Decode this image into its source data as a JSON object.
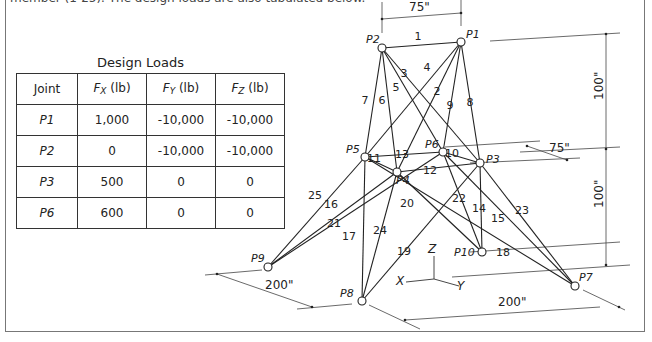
{
  "header": {
    "partial_text": "member (1-25). The design loads are also tabulated below."
  },
  "design_loads": {
    "title": "Design Loads",
    "columns": [
      "Joint",
      "Fx (lb)",
      "Fy (lb)",
      "Fz (lb)"
    ],
    "column_symbols": [
      {
        "sym": "",
        "sub": "",
        "unit": "Joint"
      },
      {
        "sym": "F",
        "sub": "X",
        "unit": " (lb)"
      },
      {
        "sym": "F",
        "sub": "Y",
        "unit": " (lb)"
      },
      {
        "sym": "F",
        "sub": "Z",
        "unit": " (lb)"
      }
    ],
    "rows": [
      {
        "joint": "P1",
        "fx": "1,000",
        "fy": "-10,000",
        "fz": "-10,000"
      },
      {
        "joint": "P2",
        "fx": "0",
        "fy": "-10,000",
        "fz": "-10,000"
      },
      {
        "joint": "P3",
        "fx": "500",
        "fy": "0",
        "fz": "0"
      },
      {
        "joint": "P6",
        "fx": "600",
        "fy": "0",
        "fz": "0"
      }
    ]
  },
  "truss": {
    "nodes": {
      "P1": {
        "x": 461,
        "y": 42,
        "label": "P1"
      },
      "P2": {
        "x": 382,
        "y": 48,
        "label": "P2"
      },
      "P3": {
        "x": 480,
        "y": 163,
        "label": "P3"
      },
      "P4": {
        "x": 397,
        "y": 172,
        "label": "P4"
      },
      "P5": {
        "x": 365,
        "y": 157,
        "label": "P5"
      },
      "P6": {
        "x": 443,
        "y": 152,
        "label": "P6"
      },
      "P7": {
        "x": 575,
        "y": 286,
        "label": "P7"
      },
      "P8": {
        "x": 362,
        "y": 301,
        "label": "P8"
      },
      "P9": {
        "x": 268,
        "y": 267,
        "label": "P9"
      },
      "P10": {
        "x": 482,
        "y": 252,
        "label": "P10"
      }
    },
    "members": [
      {
        "id": "1",
        "from": "P2",
        "to": "P1"
      },
      {
        "id": "2",
        "from": "P1",
        "to": "P4"
      },
      {
        "id": "3",
        "from": "P2",
        "to": "P3"
      },
      {
        "id": "4",
        "from": "P1",
        "to": "P5"
      },
      {
        "id": "5",
        "from": "P2",
        "to": "P6"
      },
      {
        "id": "6",
        "from": "P2",
        "to": "P4"
      },
      {
        "id": "7",
        "from": "P2",
        "to": "P5"
      },
      {
        "id": "8",
        "from": "P1",
        "to": "P3"
      },
      {
        "id": "9",
        "from": "P1",
        "to": "P6"
      },
      {
        "id": "10",
        "from": "P6",
        "to": "P3"
      },
      {
        "id": "11",
        "from": "P5",
        "to": "P4"
      },
      {
        "id": "12",
        "from": "P4",
        "to": "P3"
      },
      {
        "id": "13",
        "from": "P5",
        "to": "P6"
      },
      {
        "id": "14",
        "from": "P3",
        "to": "P10"
      },
      {
        "id": "15",
        "from": "P6",
        "to": "P7"
      },
      {
        "id": "16",
        "from": "P4",
        "to": "P9"
      },
      {
        "id": "17",
        "from": "P5",
        "to": "P8"
      },
      {
        "id": "18",
        "from": "P5",
        "to": "P7"
      },
      {
        "id": "19",
        "from": "P3",
        "to": "P8"
      },
      {
        "id": "20",
        "from": "P4",
        "to": "P10"
      },
      {
        "id": "21",
        "from": "P6",
        "to": "P9"
      },
      {
        "id": "22",
        "from": "P6",
        "to": "P10"
      },
      {
        "id": "23",
        "from": "P3",
        "to": "P7"
      },
      {
        "id": "24",
        "from": "P4",
        "to": "P8"
      },
      {
        "id": "25",
        "from": "P5",
        "to": "P9"
      }
    ],
    "member_labels": [
      {
        "id": "1",
        "x": 418,
        "y": 40
      },
      {
        "id": "2",
        "x": 437,
        "y": 95
      },
      {
        "id": "3",
        "x": 404,
        "y": 77
      },
      {
        "id": "4",
        "x": 427,
        "y": 71
      },
      {
        "id": "5",
        "x": 396,
        "y": 91
      },
      {
        "id": "6",
        "x": 382,
        "y": 104
      },
      {
        "id": "7",
        "x": 365,
        "y": 104
      },
      {
        "id": "8",
        "x": 470,
        "y": 106
      },
      {
        "id": "9",
        "x": 450,
        "y": 109
      },
      {
        "id": "10",
        "x": 452,
        "y": 157
      },
      {
        "id": "11",
        "x": 374,
        "y": 162
      },
      {
        "id": "12",
        "x": 430,
        "y": 174
      },
      {
        "id": "13",
        "x": 402,
        "y": 158
      },
      {
        "id": "14",
        "x": 479,
        "y": 212
      },
      {
        "id": "15",
        "x": 498,
        "y": 222
      },
      {
        "id": "16",
        "x": 331,
        "y": 208
      },
      {
        "id": "17",
        "x": 349,
        "y": 240
      },
      {
        "id": "18",
        "x": 503,
        "y": 256
      },
      {
        "id": "19",
        "x": 404,
        "y": 255
      },
      {
        "id": "20",
        "x": 407,
        "y": 207
      },
      {
        "id": "21",
        "x": 334,
        "y": 227
      },
      {
        "id": "22",
        "x": 459,
        "y": 202
      },
      {
        "id": "23",
        "x": 522,
        "y": 214
      },
      {
        "id": "24",
        "x": 380,
        "y": 234
      },
      {
        "id": "25",
        "x": 315,
        "y": 199
      }
    ],
    "dimensions": {
      "top_width": "75\"",
      "right_width": "75\"",
      "upper_height": "100\"",
      "lower_height": "100\"",
      "base_left": "200\"",
      "base_right": "200\""
    },
    "axes": {
      "x": "X",
      "y": "Y",
      "z": "Z"
    },
    "line_color": "#222222",
    "dim_color": "#333333"
  }
}
